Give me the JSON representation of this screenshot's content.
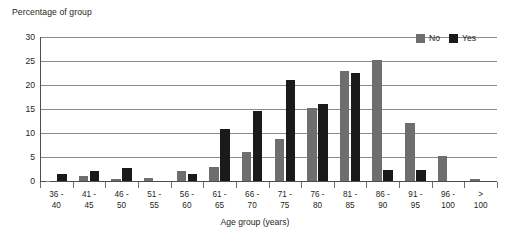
{
  "chart_data": {
    "type": "bar",
    "title": "",
    "ylabel": "Percentage of group",
    "xlabel": "Age group (years)",
    "ylim": [
      0,
      30
    ],
    "yticks": [
      0,
      5,
      10,
      15,
      20,
      25,
      30
    ],
    "grid": true,
    "legend_position": "top-right",
    "categories": [
      "36 - 40",
      "41 - 45",
      "46 - 50",
      "51 - 55",
      "56 - 60",
      "61 - 65",
      "66 - 70",
      "71 - 75",
      "76 - 80",
      "81 - 85",
      "86 - 90",
      "91 - 95",
      "96 - 100",
      "> 100"
    ],
    "category_lines": [
      [
        "36 -",
        "40"
      ],
      [
        "41 -",
        "45"
      ],
      [
        "46 -",
        "50"
      ],
      [
        "51 -",
        "55"
      ],
      [
        "56 -",
        "60"
      ],
      [
        "61 -",
        "65"
      ],
      [
        "66 -",
        "70"
      ],
      [
        "71 -",
        "75"
      ],
      [
        "76 -",
        "80"
      ],
      [
        "81 -",
        "85"
      ],
      [
        "86 -",
        "90"
      ],
      [
        "91 -",
        "95"
      ],
      [
        "96 -",
        "100"
      ],
      [
        ">",
        "100"
      ]
    ],
    "series": [
      {
        "name": "No",
        "color": "#6d6e70",
        "values": [
          0,
          1.0,
          0.5,
          0.7,
          2.0,
          3.0,
          6.0,
          8.8,
          15.3,
          23.0,
          25.2,
          12.0,
          5.3,
          0.5
        ]
      },
      {
        "name": "Yes",
        "color": "#1a1a1a",
        "values": [
          1.5,
          2.0,
          2.8,
          0,
          1.5,
          10.8,
          14.6,
          21.0,
          16.0,
          22.5,
          2.3,
          2.3,
          0,
          0
        ]
      }
    ]
  },
  "legend": {
    "items": [
      {
        "label": "No",
        "color": "#6d6e70"
      },
      {
        "label": "Yes",
        "color": "#1a1a1a"
      }
    ]
  }
}
